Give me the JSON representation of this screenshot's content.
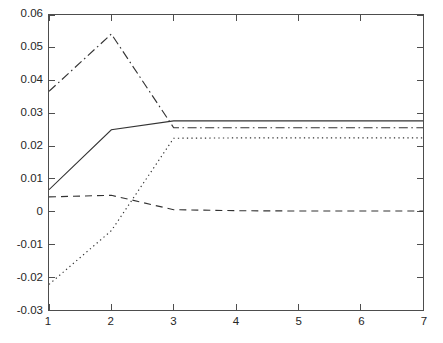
{
  "chart_data": {
    "type": "line",
    "title": "",
    "subtitle": "",
    "xlabel": "",
    "ylabel": "",
    "x": [
      1,
      2,
      3,
      4,
      5,
      6,
      7
    ],
    "xlim": [
      1,
      7
    ],
    "ylim": [
      -0.03,
      0.06
    ],
    "xticks": [
      1,
      2,
      3,
      4,
      5,
      6,
      7
    ],
    "yticks": [
      -0.03,
      -0.02,
      -0.01,
      0,
      0.01,
      0.02,
      0.03,
      0.04,
      0.05,
      0.06
    ],
    "xtick_labels": [
      "1",
      "2",
      "3",
      "4",
      "5",
      "6",
      "7"
    ],
    "ytick_labels": [
      "0.06",
      "0.05",
      "0.04",
      "0.03",
      "0.02",
      "0.01",
      "0",
      "-0.01",
      "-0.02",
      "-0.03"
    ],
    "grid": false,
    "legend": null,
    "legend_position": "none",
    "box": true,
    "series": [
      {
        "name": "series-solid",
        "style": "solid",
        "color": "#333333",
        "values": [
          0.0067,
          0.025,
          0.0277,
          0.0277,
          0.0277,
          0.0277,
          0.0277
        ]
      },
      {
        "name": "series-dashed",
        "style": "dashed",
        "color": "#333333",
        "values": [
          0.0045,
          0.005,
          0.0006,
          0.0003,
          0.0002,
          0.0002,
          0.0002
        ]
      },
      {
        "name": "series-dashdot",
        "style": "dashdot",
        "color": "#333333",
        "values": [
          0.0367,
          0.0542,
          0.0256,
          0.0256,
          0.0256,
          0.0256,
          0.0256
        ]
      },
      {
        "name": "series-dotted",
        "style": "dotted",
        "color": "#333333",
        "values": [
          -0.0222,
          -0.0058,
          0.0224,
          0.0225,
          0.0225,
          0.0225,
          0.0225
        ]
      }
    ],
    "axis_color": "#4d4d4d",
    "background_color": "#ffffff"
  }
}
